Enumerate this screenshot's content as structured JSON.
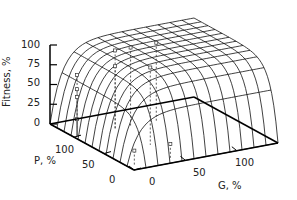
{
  "chart_data": {
    "type": "surface3d",
    "title": "",
    "xlabel": "G, %",
    "ylabel": "P, %",
    "zlabel": "Fitness, %",
    "x_ticks": [
      "0",
      "50",
      "100"
    ],
    "y_ticks": [
      "0",
      "50",
      "100"
    ],
    "z_ticks": [
      "0",
      "25",
      "50",
      "75",
      "100"
    ],
    "xlim": [
      0,
      140
    ],
    "ylim": [
      0,
      140
    ],
    "zlim": [
      0,
      100
    ],
    "grid": false,
    "legend": null,
    "surface": {
      "description": "Saturating fitness surface: Fitness rises steeply from 0 at G=0 or P=0 and plateaus near 100% at high G and P",
      "model": "100*(1-exp(-G/12))*(1-exp(-P/12))",
      "grid_steps": 12
    },
    "points": [
      {
        "G": 3,
        "P": 100,
        "fitness": 78
      },
      {
        "G": 3,
        "P": 100,
        "fitness": 60
      },
      {
        "G": 3,
        "P": 100,
        "fitness": 50
      },
      {
        "G": 3,
        "P": 100,
        "fitness": 22
      },
      {
        "G": 5,
        "P": 8,
        "fitness": 20
      },
      {
        "G": 40,
        "P": 100,
        "fitness": 100
      },
      {
        "G": 40,
        "P": 100,
        "fitness": 80
      },
      {
        "G": 55,
        "P": 100,
        "fitness": 100
      },
      {
        "G": 80,
        "P": 100,
        "fitness": 100
      },
      {
        "G": 45,
        "P": 50,
        "fitness": 98
      },
      {
        "G": 40,
        "P": 8,
        "fitness": 20
      }
    ]
  },
  "labels": {
    "z_axis": "Fitness, %",
    "p_axis": "P, %",
    "g_axis": "G, %",
    "z_ticks": [
      "100",
      "75",
      "50",
      "25",
      "0"
    ],
    "p_ticks": [
      "100",
      "50",
      "0"
    ],
    "g_ticks": [
      "0",
      "50",
      "100"
    ]
  }
}
